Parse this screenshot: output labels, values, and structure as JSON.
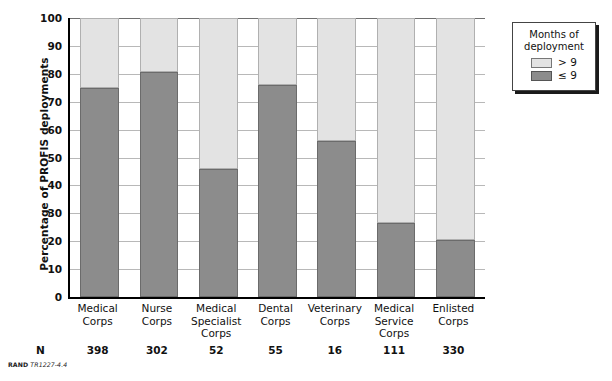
{
  "chart_data": {
    "type": "bar",
    "subtype": "stacked-percentage",
    "title": "",
    "xlabel": "",
    "ylabel": "Percentage of PROFIS deployments",
    "ylim": [
      0,
      100
    ],
    "ytick_step": 10,
    "yticks": [
      "100",
      "90",
      "80",
      "70",
      "60",
      "50",
      "40",
      "30",
      "20",
      "10",
      "0"
    ],
    "grid": true,
    "grid_axis": "y",
    "legend_position": "outside-right-top",
    "categories": [
      "Medical Corps",
      "Nurse Corps",
      "Medical Specialist Corps",
      "Dental Corps",
      "Veterinary Corps",
      "Medical Service Corps",
      "Enlisted Corps"
    ],
    "category_lines": [
      [
        "Medical",
        "Corps"
      ],
      [
        "Nurse",
        "Corps"
      ],
      [
        "Medical",
        "Specialist",
        "Corps"
      ],
      [
        "Dental",
        "Corps"
      ],
      [
        "Veterinary",
        "Corps"
      ],
      [
        "Medical",
        "Service",
        "Corps"
      ],
      [
        "Enlisted",
        "Corps"
      ]
    ],
    "series": [
      {
        "name": "≤ 9",
        "color": "#8c8c8c",
        "values": [
          75,
          80.5,
          46,
          76,
          55.8,
          26.5,
          20.3
        ]
      },
      {
        "name": "> 9",
        "color": "#e3e3e3",
        "values": [
          25,
          19.5,
          54,
          24,
          44.2,
          73.5,
          79.7
        ]
      }
    ],
    "n_row_label": "N",
    "n_values": [
      "398",
      "302",
      "52",
      "55",
      "16",
      "111",
      "330"
    ]
  },
  "legend": {
    "title_line1": "Months of",
    "title_line2": "deployment",
    "items": [
      {
        "label": "> 9",
        "swatch": "light-swatch"
      },
      {
        "label": "≤ 9",
        "swatch": "dark-swatch"
      }
    ]
  },
  "source_note": {
    "brand": "RAND",
    "document": "TR1227-4.4"
  }
}
